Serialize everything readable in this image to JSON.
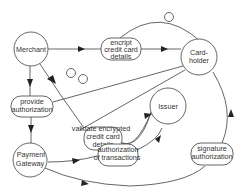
{
  "diagram": {
    "type": "flowchart",
    "nodes": {
      "merchant": {
        "label": "Merchant",
        "shape": "circle"
      },
      "encrypt": {
        "label_lines": [
          "encript",
          "credit card",
          "details"
        ],
        "shape": "rounded-rect"
      },
      "cardholder": {
        "label_lines": [
          "Card-",
          "holder"
        ],
        "shape": "circle"
      },
      "provide_auth": {
        "label_lines": [
          "provide",
          "authorization"
        ],
        "shape": "rounded-rect"
      },
      "validate": {
        "label_lines": [
          "validate encrypted",
          "credit card",
          "details"
        ],
        "shape": "rounded-rect"
      },
      "issuer": {
        "label": "Issuer",
        "shape": "circle"
      },
      "payment_gateway": {
        "label_lines": [
          "Payment",
          "Gateway"
        ],
        "shape": "circle"
      },
      "auth_transactions": {
        "label_lines": [
          "authorization",
          "of transactions"
        ],
        "shape": "rounded-rect"
      },
      "signature_auth": {
        "label_lines": [
          "signature",
          "authorization"
        ],
        "shape": "rounded-rect"
      }
    },
    "edges": [
      {
        "from": "Merchant",
        "to": "encript credit card details",
        "arrow": true
      },
      {
        "from": "encript credit card details",
        "to": "Card-holder",
        "arrow": true
      },
      {
        "from": "encript credit card details",
        "to": "Card-holder",
        "via": "top arc",
        "marker": "small circle"
      },
      {
        "from": "Merchant",
        "to": "provide authorization",
        "arrow": true
      },
      {
        "from": "Merchant",
        "to": "validate encrypted credit card details",
        "arrow": true
      },
      {
        "from": "provide authorization",
        "to": "Card-holder",
        "marker": "small circle"
      },
      {
        "from": "validate encrypted credit card details",
        "to": "Card-holder",
        "marker": "small circle"
      },
      {
        "from": "validate encrypted credit card details",
        "to": "Issuer",
        "arrow": true
      },
      {
        "from": "provide authorization",
        "to": "Payment Gateway",
        "arrow": true
      },
      {
        "from": "Payment Gateway",
        "to": "authorization of transactions",
        "arrow": true
      },
      {
        "from": "authorization of transactions",
        "to": "Issuer",
        "arrow": true
      },
      {
        "from": "Payment Gateway",
        "to": "signature authorization",
        "arrow": true
      },
      {
        "from": "signature authorization",
        "to": "Card-holder",
        "arrow": true
      }
    ],
    "colors": {
      "stroke": "#555555",
      "arrow_fill": "#222222",
      "text": "#333333",
      "background": "#ffffff"
    }
  }
}
